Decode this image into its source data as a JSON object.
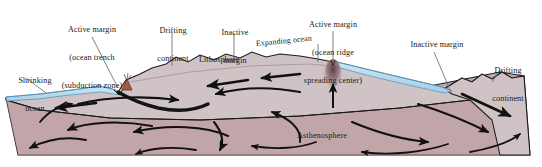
{
  "figure": {
    "background_color": "#ffffff"
  },
  "colors": {
    "ocean_water": "#b9d9ea",
    "ocean_water_edge": "#7fb4cf",
    "lithosphere": "#cfc3c6",
    "lithosphere_dark": "#c2b2b6",
    "asthenosphere": "#c6a9ae",
    "asthenosphere_deep": "#bb9da3",
    "outline": "#1b1b1b",
    "arrow": "#111111",
    "volcano": "#a8563c",
    "ridge_plume": "#6e4b52",
    "leader_line": "#555555",
    "text": "#1a1a1a"
  },
  "labels": [
    {
      "id": "shrinking-ocean",
      "lines": [
        "Shrinking",
        "ocean"
      ],
      "x": 4,
      "y": 60
    },
    {
      "id": "active-margin-trench",
      "lines": [
        "Active margin",
        "(ocean trench",
        "(subduction zone)"
      ],
      "x": 48,
      "y": 8
    },
    {
      "id": "drifting-continent-left",
      "lines": [
        "Drifting",
        "continent"
      ],
      "x": 148,
      "y": 10
    },
    {
      "id": "inactive-margin-left",
      "lines": [
        "Inactive",
        "margin"
      ],
      "x": 212,
      "y": 12
    },
    {
      "id": "active-margin-ridge",
      "lines": [
        "Active margin",
        "(ocean ridge",
        "spreading center)"
      ],
      "x": 294,
      "y": 2
    },
    {
      "id": "expanding-ocean",
      "lines": [
        "Expanding ocean"
      ],
      "x": 258,
      "y": 42
    },
    {
      "id": "inactive-margin-right",
      "lines": [
        "Inactive margin"
      ],
      "x": 400,
      "y": 42
    },
    {
      "id": "drifting-continent-right",
      "lines": [
        "Drifting",
        "continent"
      ],
      "x": 484,
      "y": 50
    }
  ],
  "interior_labels": [
    {
      "id": "lithosphere",
      "text": "Lithosphere",
      "x": 200,
      "y": 60
    },
    {
      "id": "asthenosphere",
      "text": "Asthenosphere",
      "x": 292,
      "y": 136
    }
  ],
  "features": {
    "ocean_basins": [
      "shrinking ocean (left)",
      "expanding ocean (right)"
    ],
    "subduction_zone_x": 118,
    "spreading_ridge_x": 333,
    "volcano_present": true,
    "convection_cells": 4,
    "mantle_arrow_count": 14
  }
}
